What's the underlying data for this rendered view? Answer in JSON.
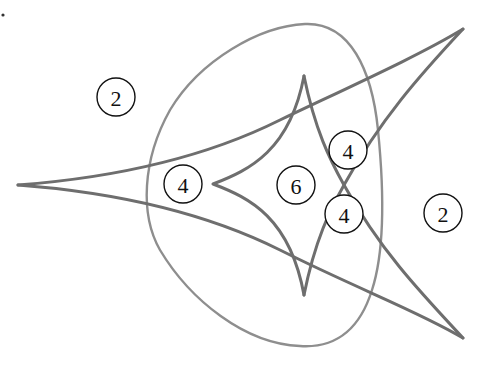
{
  "diagram": {
    "title": "",
    "colors": {
      "background": "#ffffff",
      "outer_curve": "#6e6e6e",
      "inner_deltoid": "#6e6e6e",
      "oval": "#8e8e8e",
      "labels": "#111111"
    },
    "curves": [
      {
        "id": "outer-three-cusp-curve",
        "description": "curve with cusps at left, top-right and bottom-right; arms cross in the middle-right"
      },
      {
        "id": "inner-deltoid",
        "description": "three-cusped deltoid with cusps at left, top and bottom"
      },
      {
        "id": "oval",
        "description": "rounded triangular closed curve surrounding the deltoid"
      }
    ],
    "region_labels": [
      {
        "id": "outside-top-left",
        "value": "2",
        "x": 116,
        "y": 97
      },
      {
        "id": "left-inside-oval",
        "value": "4",
        "x": 183,
        "y": 184
      },
      {
        "id": "inside-deltoid",
        "value": "6",
        "x": 296,
        "y": 185
      },
      {
        "id": "upper-crossing",
        "value": "4",
        "x": 348,
        "y": 150
      },
      {
        "id": "lower-crossing",
        "value": "4",
        "x": 344,
        "y": 214
      },
      {
        "id": "outside-right",
        "value": "2",
        "x": 443,
        "y": 213
      }
    ]
  }
}
